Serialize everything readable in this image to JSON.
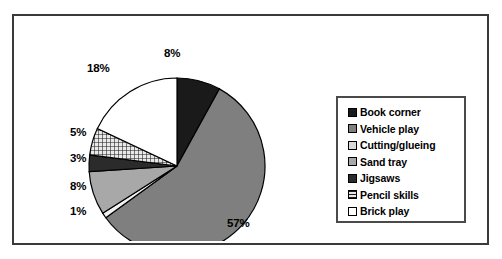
{
  "chart_data": {
    "type": "pie",
    "title": "",
    "categories": [
      "Book corner",
      "Vehicle play",
      "Cutting/glueing",
      "Sand tray",
      "Jigsaws",
      "Pencil skills",
      "Brick play"
    ],
    "values": [
      8,
      57,
      1,
      8,
      3,
      5,
      18
    ],
    "value_labels": [
      "8%",
      "57%",
      "1%",
      "8%",
      "3%",
      "5%",
      "18%"
    ],
    "unit": "%",
    "total": 100,
    "start_angle_deg": 0,
    "direction": "clockwise",
    "legend_position": "right",
    "grid": false,
    "slices": [
      {
        "label": "Book corner",
        "value": 8,
        "display": "8%",
        "fill": "#1a1a1a",
        "pattern": "solid",
        "start_deg": 0.0,
        "end_deg": 28.8
      },
      {
        "label": "Vehicle play",
        "value": 57,
        "display": "57%",
        "fill": "#7f7f7f",
        "pattern": "solid",
        "start_deg": 28.8,
        "end_deg": 234.0
      },
      {
        "label": "Cutting/glueing",
        "value": 1,
        "display": "1%",
        "fill": "#f2f2f2",
        "pattern": "solid",
        "start_deg": 234.0,
        "end_deg": 237.6
      },
      {
        "label": "Sand tray",
        "value": 8,
        "display": "8%",
        "fill": "#a8a8a8",
        "pattern": "solid",
        "start_deg": 237.6,
        "end_deg": 266.4
      },
      {
        "label": "Jigsaws",
        "value": 3,
        "display": "3%",
        "fill": "#2b2b2b",
        "pattern": "solid",
        "start_deg": 266.4,
        "end_deg": 277.2
      },
      {
        "label": "Pencil skills",
        "value": 5,
        "display": "5%",
        "fill": "#d0d0d0",
        "pattern": "crosshatch",
        "start_deg": 277.2,
        "end_deg": 295.2
      },
      {
        "label": "Brick play",
        "value": 18,
        "display": "18%",
        "fill": "#ffffff",
        "pattern": "solid",
        "start_deg": 295.2,
        "end_deg": 360.0
      }
    ]
  },
  "legend": {
    "items": [
      {
        "label": "Book corner",
        "swatch": "#1a1a1a",
        "pattern": "solid"
      },
      {
        "label": "Vehicle play",
        "swatch": "#7f7f7f",
        "pattern": "solid"
      },
      {
        "label": "Cutting/glueing",
        "swatch": "#d9d9d9",
        "pattern": "solid"
      },
      {
        "label": "Sand tray",
        "swatch": "#a8a8a8",
        "pattern": "solid"
      },
      {
        "label": "Jigsaws",
        "swatch": "#2b2b2b",
        "pattern": "solid"
      },
      {
        "label": "Pencil skills",
        "swatch": "#d0d0d0",
        "pattern": "crosshatch"
      },
      {
        "label": "Brick play",
        "swatch": "#ffffff",
        "pattern": "solid"
      }
    ]
  },
  "labels": {
    "book_corner": "8%",
    "vehicle_play": "57%",
    "cutting_glueing": "1%",
    "sand_tray": "8%",
    "jigsaws": "3%",
    "pencil_skills": "5%",
    "brick_play": "18%"
  },
  "colors": {
    "frame_border": "#3a3a3a",
    "legend_border": "#4a4a4a",
    "slice_outline": "#000000",
    "background": "#ffffff"
  }
}
